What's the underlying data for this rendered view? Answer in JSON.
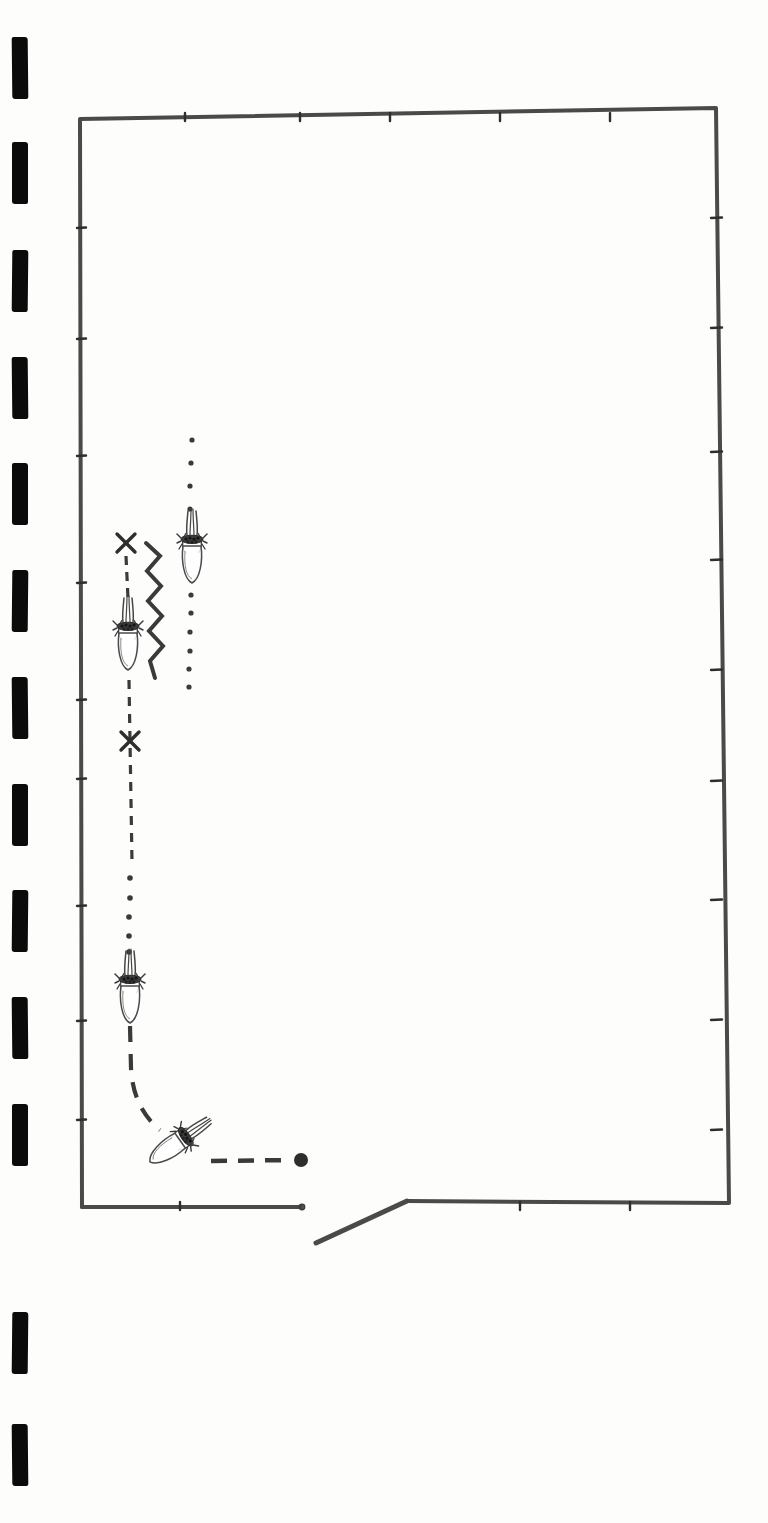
{
  "document": {
    "type": "scanned-figure",
    "title": "Hand-drawn bee waggle dance diagram on comb frame",
    "background_color": "#fdfdfc",
    "ink_color": "#3a3a3a",
    "mark_color": "#0b0b0b",
    "page_width": 768,
    "page_height": 1523
  },
  "scan_marks": {
    "name": "film-sprocket-marks",
    "count": 13,
    "color": "#0b0b0b",
    "width": 16,
    "height": 62,
    "x": 12,
    "items": [
      {
        "y": 37
      },
      {
        "y": 142
      },
      {
        "y": 250
      },
      {
        "y": 357
      },
      {
        "y": 463
      },
      {
        "y": 570
      },
      {
        "y": 677
      },
      {
        "y": 784
      },
      {
        "y": 890
      },
      {
        "y": 997
      },
      {
        "y": 1104
      },
      {
        "y": 1312
      },
      {
        "y": 1424
      }
    ]
  },
  "frame": {
    "name": "comb-frame-outline",
    "stroke_color": "#4a4a4a",
    "stroke_width": 4,
    "top_left": [
      80,
      119
    ],
    "top_right": [
      716,
      108
    ],
    "bottom_right": [
      729,
      1203
    ],
    "bottom_left": [
      82,
      1207
    ],
    "bottom_gap_left_end": [
      302,
      1207
    ],
    "bottom_gap_right_start": [
      407,
      1201
    ],
    "entrance_ramp": [
      [
        316,
        1243
      ],
      [
        407,
        1201
      ]
    ],
    "tick_marks_left": [
      228,
      339,
      456,
      583,
      700,
      779,
      906,
      1021,
      1120
    ],
    "tick_marks_right": [
      218,
      328,
      452,
      560,
      670,
      781,
      900,
      1020,
      1130
    ],
    "tick_marks_top": [
      185,
      300,
      390,
      500,
      610
    ],
    "tick_marks_bottom": [
      180,
      520,
      630
    ]
  },
  "bees": [
    {
      "id": "bee-1",
      "label": "bee-upper-dotted-path",
      "x": 192,
      "y": 545,
      "rotation": 0,
      "scale": 1.0
    },
    {
      "id": "bee-2",
      "label": "bee-waggle-run",
      "x": 128,
      "y": 632,
      "rotation": 0,
      "scale": 1.0
    },
    {
      "id": "bee-3",
      "label": "bee-return-path",
      "x": 130,
      "y": 985,
      "rotation": 0,
      "scale": 1.0
    },
    {
      "id": "bee-4",
      "label": "bee-at-entrance",
      "x": 181,
      "y": 1140,
      "rotation": 55,
      "scale": 1.0
    }
  ],
  "paths": {
    "dotted_trail_upper": {
      "name": "dotted-trail-above-bee-1",
      "dot_color": "#3a3a3a",
      "dot_radius": 2.6,
      "points": [
        [
          192,
          440
        ],
        [
          191,
          463
        ],
        [
          190,
          486
        ],
        [
          190,
          509
        ]
      ]
    },
    "dotted_trail_lower": {
      "name": "dotted-trail-below-bee-1",
      "dot_color": "#3a3a3a",
      "dot_radius": 2.6,
      "points": [
        [
          191,
          595
        ],
        [
          191,
          613
        ],
        [
          190,
          632
        ],
        [
          190,
          651
        ],
        [
          189,
          669
        ],
        [
          189,
          687
        ]
      ]
    },
    "dashed_upper": {
      "name": "dashed-path-above-bee-2",
      "stroke_color": "#3a3a3a",
      "stroke_width": 3.2,
      "dash": "9 7",
      "from": [
        126,
        556
      ],
      "to": [
        128,
        598
      ]
    },
    "dashed_mid": {
      "name": "dashed-path-below-bee-2",
      "stroke_color": "#3a3a3a",
      "stroke_width": 3.2,
      "dash": "9 8",
      "from": [
        129,
        680
      ],
      "to": [
        132,
        862
      ]
    },
    "dotted_mid": {
      "name": "dotted-trail-above-bee-3",
      "dot_color": "#3a3a3a",
      "dot_radius": 2.8,
      "points": [
        [
          130,
          878
        ],
        [
          130,
          898
        ],
        [
          129,
          917
        ],
        [
          129,
          936
        ],
        [
          129,
          952
        ]
      ]
    },
    "dashed_curve": {
      "name": "dashed-curve-to-entrance",
      "stroke_color": "#3a3a3a",
      "stroke_width": 4.2,
      "dash": "16 12",
      "d": "M 130 1026 L 131 1068 Q 133 1108 160 1130"
    },
    "dashed_exit": {
      "name": "dashed-path-to-terminus",
      "stroke_color": "#3a3a3a",
      "stroke_width": 4.5,
      "dash": "16 11",
      "from": [
        211,
        1161
      ],
      "to": [
        292,
        1160
      ]
    },
    "terminus_dot": {
      "name": "path-terminus-dot",
      "x": 301,
      "y": 1160,
      "radius": 7,
      "color": "#2e2e2e"
    }
  },
  "waggle": {
    "name": "zigzag-waggle-line",
    "stroke_color": "#3a3a3a",
    "stroke_width": 4,
    "amplitude": 14,
    "points": [
      [
        146,
        543
      ],
      [
        160,
        556
      ],
      [
        147,
        571
      ],
      [
        161,
        586
      ],
      [
        148,
        601
      ],
      [
        162,
        616
      ],
      [
        149,
        631
      ],
      [
        163,
        646
      ],
      [
        150,
        661
      ],
      [
        155,
        678
      ]
    ]
  },
  "x_marks": [
    {
      "name": "x-mark-upper",
      "x": 126,
      "y": 543,
      "size": 9
    },
    {
      "name": "x-mark-lower",
      "x": 130,
      "y": 741,
      "size": 9
    }
  ]
}
